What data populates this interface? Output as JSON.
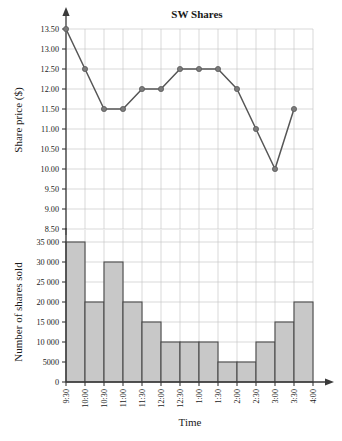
{
  "chart_data": [
    {
      "type": "line",
      "title": "SW Shares",
      "xlabel": "",
      "ylabel": "Share price ($)",
      "x": [
        "9:30",
        "10:00",
        "10:30",
        "11:00",
        "11:30",
        "12:00",
        "12:30",
        "1:00",
        "1:30",
        "2:00",
        "2:30",
        "3:00",
        "3:30",
        "4:00"
      ],
      "values": [
        13.5,
        12.5,
        11.5,
        11.5,
        12.0,
        12.0,
        12.5,
        12.5,
        12.5,
        12.0,
        11.0,
        10.0,
        11.5
      ],
      "ylim": [
        8.5,
        13.5
      ],
      "yticks": [
        8.5,
        9.0,
        9.5,
        10.0,
        10.5,
        11.0,
        11.5,
        12.0,
        12.5,
        13.0,
        13.5
      ],
      "ytick_labels": [
        "8.50",
        "9.00",
        "9.50",
        "10.00",
        "10.50",
        "11.00",
        "11.50",
        "12.00",
        "12.50",
        "13.00",
        "13.50"
      ],
      "grid": true,
      "legend": "none",
      "marker_color": "#7a7a7a",
      "line_color": "#565656"
    },
    {
      "type": "bar",
      "title": "",
      "xlabel": "Time",
      "ylabel": "Number of shares sold",
      "categories": [
        "9:30",
        "10:00",
        "10:30",
        "11:00",
        "11:30",
        "12:00",
        "12:30",
        "1:00",
        "1:30",
        "2:00",
        "2:30",
        "3:00",
        "3:30",
        "4:00"
      ],
      "values": [
        35000,
        20000,
        30000,
        20000,
        15000,
        10000,
        10000,
        10000,
        5000,
        5000,
        10000,
        15000,
        20000
      ],
      "ylim": [
        0,
        35000
      ],
      "yticks": [
        0,
        5000,
        10000,
        15000,
        20000,
        25000,
        30000,
        35000
      ],
      "ytick_labels": [
        "0",
        "5000",
        "10 000",
        "15 000",
        "20 000",
        "25 000",
        "30 000",
        "35 000"
      ],
      "grid": true,
      "legend": "none",
      "bar_color": "#c8c8c8",
      "bar_edge_color": "#4a4a4a"
    }
  ]
}
